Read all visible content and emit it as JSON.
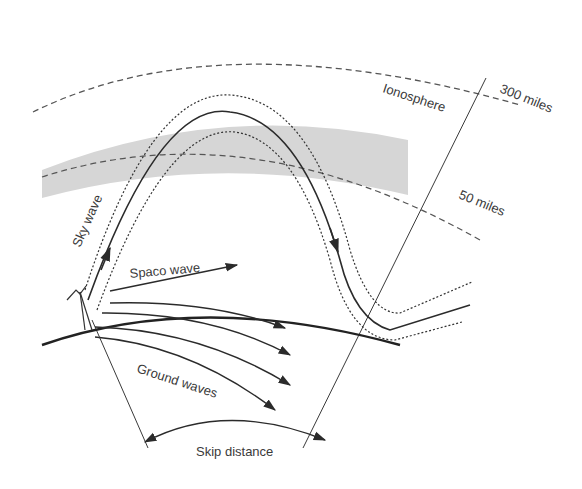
{
  "diagram": {
    "labels": {
      "ionosphere": "Ionosphere",
      "altitude_upper": "300 miles",
      "altitude_lower": "50 miles",
      "sky_wave": "Sky wave",
      "space_wave": "Spaco wave",
      "ground_waves": "Ground waves",
      "skip_distance": "Skip distance"
    },
    "colors": {
      "ionosphere_band": "#d6d6d6",
      "line": "#2b2b2b",
      "dashed": "#555555",
      "text": "#3a3a3a"
    },
    "elements": {
      "ground_wave_count": 4,
      "has_antenna": true
    }
  }
}
